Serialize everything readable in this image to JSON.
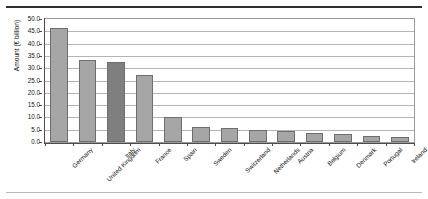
{
  "chart_data": {
    "type": "bar",
    "title": "",
    "xlabel": "",
    "ylabel": "Amount (€ billion)",
    "ylim": [
      0,
      50
    ],
    "ytick_step": 5,
    "ytick_labels": [
      "50.0",
      "45.0",
      "40.0",
      "35.0",
      "30.0",
      "25.0",
      "20.0",
      "15.0",
      "10.0",
      "5.0",
      "0.0"
    ],
    "grid": true,
    "legend": "none",
    "categories": [
      "Germany",
      "United Kingdom",
      "Italy",
      "France",
      "Spain",
      "Sweden",
      "Switzerland",
      "Netherlands",
      "Austria",
      "Belgium",
      "Denmark",
      "Portugal",
      "Ireland"
    ],
    "values": [
      46.3,
      33.5,
      32.5,
      27.2,
      10.0,
      6.0,
      5.5,
      5.0,
      4.5,
      3.7,
      3.3,
      2.6,
      2.0
    ],
    "highlight_index": 2,
    "bar_color": "#a6a6a6",
    "bar_highlight_color": "#7f7f7f",
    "bar_border_color": "#6e6e6e",
    "gridline_color": "#b4b4b4",
    "axis_color": "#4d4d4d",
    "plot_border_color": "#9a9a9a",
    "background": "#ffffff"
  },
  "rules": {
    "top_rule_color": "#2e2e2e",
    "bottom_rule_color": "#b9b9b9"
  }
}
